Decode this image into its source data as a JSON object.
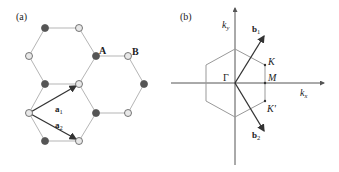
{
  "panel_a": {
    "label": "(a)",
    "site_A": "A",
    "site_B": "B",
    "vec1": {
      "name": "a",
      "sub": "1"
    },
    "vec2": {
      "name": "a",
      "sub": "2"
    },
    "colors": {
      "bond": "#b5b5b5",
      "atom_A": "#555555",
      "atom_B": "#e8e8e8",
      "arrow": "#333333"
    }
  },
  "panel_b": {
    "label": "(b)",
    "axis_x": {
      "name": "k",
      "sub": "x"
    },
    "axis_y": {
      "name": "k",
      "sub": "y"
    },
    "gamma": "Γ",
    "K": "K",
    "K_prime": "K'",
    "M": "M",
    "vec1": {
      "name": "b",
      "sub": "1"
    },
    "vec2": {
      "name": "b",
      "sub": "2"
    },
    "colors": {
      "axis": "#555555",
      "hexagon": "#999999",
      "arrow": "#333333"
    }
  }
}
